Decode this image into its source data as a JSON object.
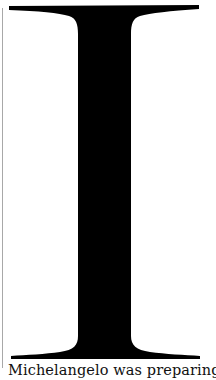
{
  "page": {
    "drop_cap": {
      "letter": "I",
      "color": "#000000"
    },
    "body_text": "Michelangelo was preparing to un"
  }
}
